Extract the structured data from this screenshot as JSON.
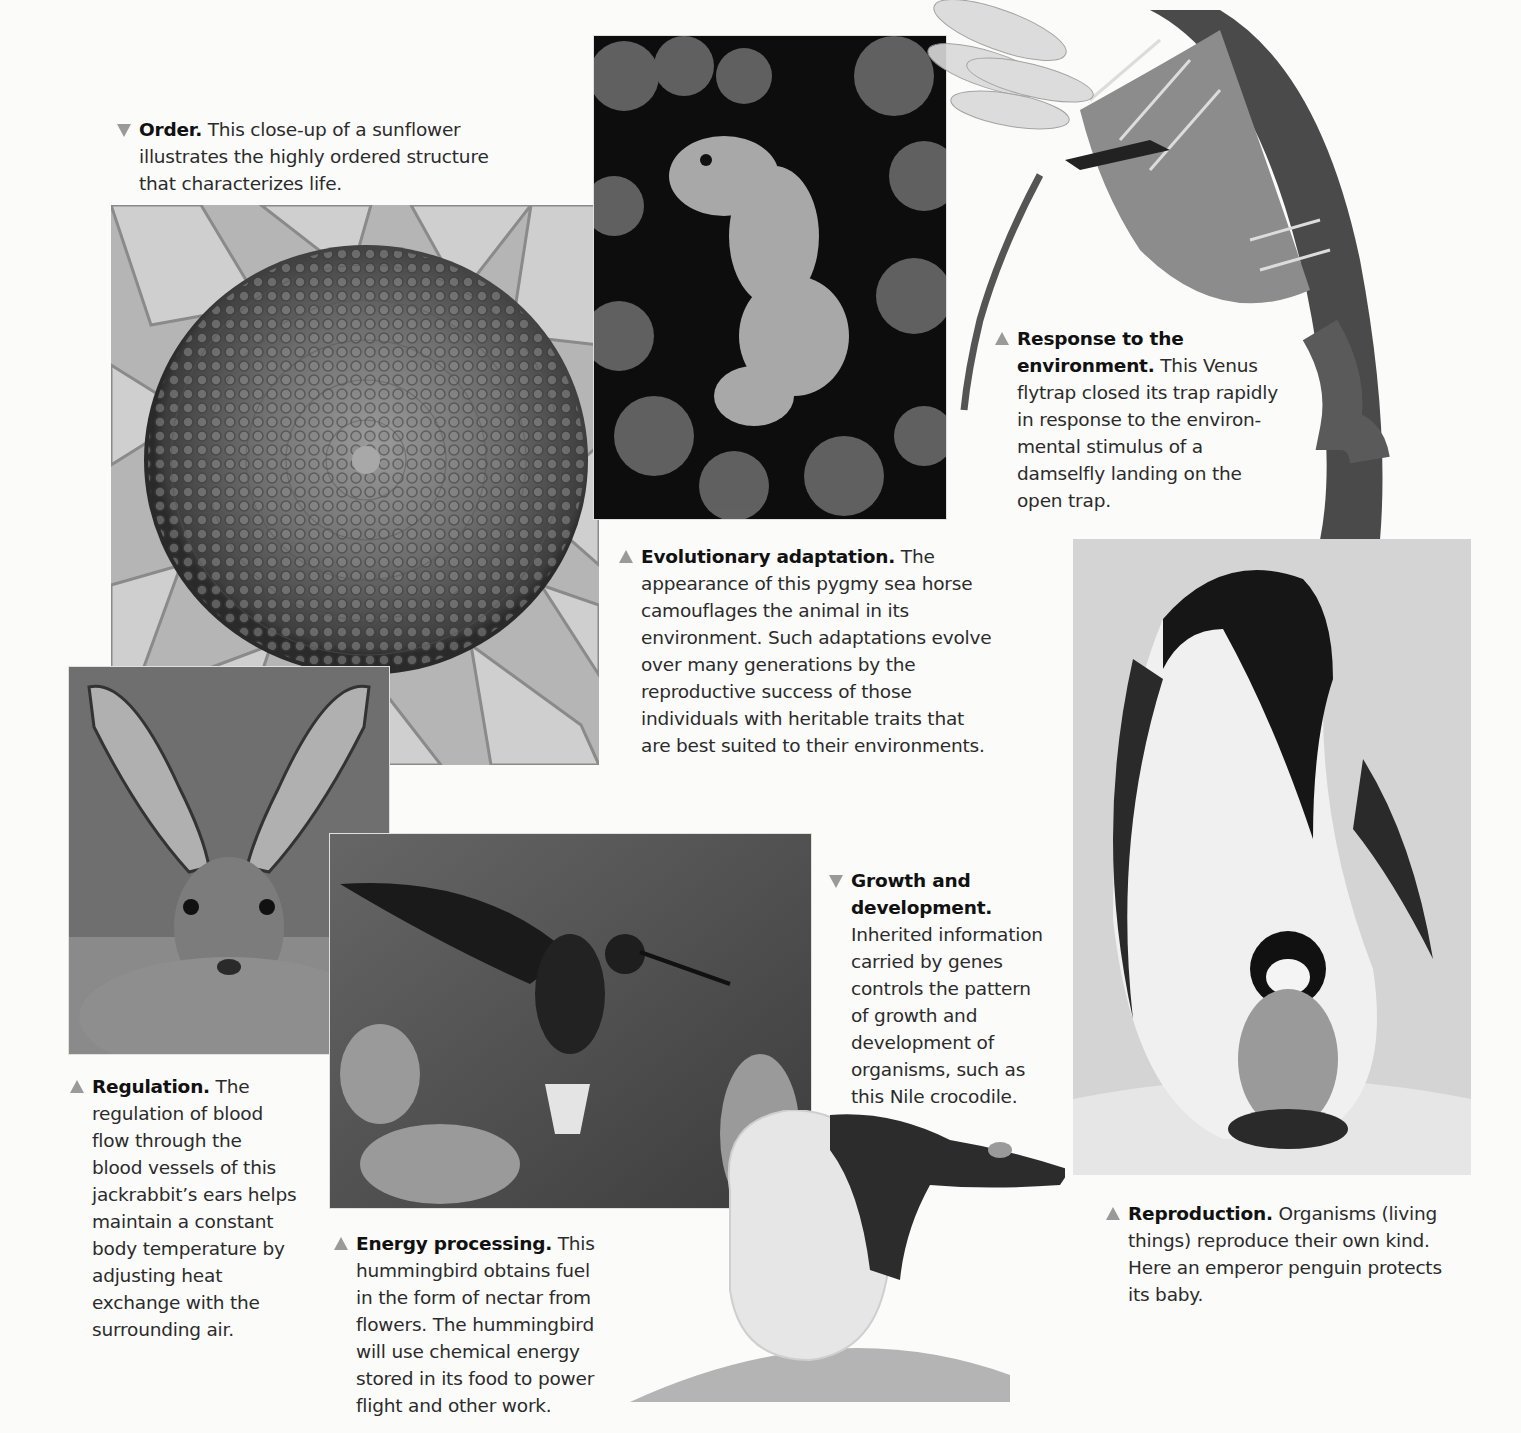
{
  "figure": {
    "marker_color": "#9a9a9a",
    "captions": {
      "order": {
        "marker": "down",
        "title": "Order.",
        "lines": [
          " This close-up of a sunflower",
          "illustrates the highly ordered structure",
          "that characterizes life."
        ]
      },
      "evolutionary_adaptation": {
        "marker": "up",
        "title": "Evolutionary adaptation.",
        "lines": [
          " The",
          "appearance of this pygmy sea horse",
          "camouflages the animal in its",
          "environment. Such adaptations evolve",
          "over many generations by the",
          "reproductive success of those",
          "individuals with heritable traits that",
          "are best suited to their environments."
        ]
      },
      "response": {
        "marker": "up",
        "title_line1": "Response to the",
        "title_line2": "environment.",
        "lines": [
          " This Venus",
          "flytrap closed its trap rapidly",
          "in response to the environ-",
          "mental stimulus of a",
          "damselfly landing on the",
          "open trap."
        ]
      },
      "regulation": {
        "marker": "up",
        "title": "Regulation.",
        "lines": [
          " The",
          "regulation of blood",
          "flow through the",
          "blood vessels of this",
          "jackrabbit’s ears helps",
          "maintain a constant",
          "body temperature by",
          "adjusting heat",
          "exchange with the",
          "surrounding air."
        ]
      },
      "energy_processing": {
        "marker": "up",
        "title": "Energy processing.",
        "lines": [
          " This",
          "hummingbird obtains fuel",
          "in the form of nectar from",
          "flowers. The hummingbird",
          "will use chemical energy",
          "stored in its food to power",
          "flight and other work."
        ]
      },
      "growth": {
        "marker": "down",
        "title_line1": "Growth and",
        "title_line2": "development.",
        "lines": [
          "Inherited information",
          "carried by genes",
          "controls the pattern",
          "of growth and",
          "development of",
          "organisms, such as",
          "this Nile crocodile."
        ]
      },
      "reproduction": {
        "marker": "up",
        "title": "Reproduction.",
        "lines": [
          " Organisms (living",
          "things) reproduce their own kind.",
          "Here an emperor penguin protects",
          "its baby."
        ]
      }
    },
    "photos": [
      {
        "id": "sunflower",
        "subject": "sunflower close-up"
      },
      {
        "id": "seahorse",
        "subject": "pygmy sea horse on coral"
      },
      {
        "id": "flytrap",
        "subject": "Venus flytrap with damselfly"
      },
      {
        "id": "jackrabbit",
        "subject": "jackrabbit"
      },
      {
        "id": "hummingbird",
        "subject": "hummingbird at flowers"
      },
      {
        "id": "crocodile",
        "subject": "Nile crocodile hatching from egg"
      },
      {
        "id": "penguin",
        "subject": "emperor penguin with chick"
      }
    ]
  }
}
